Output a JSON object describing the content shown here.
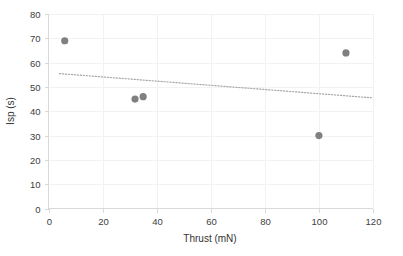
{
  "chart_data": {
    "type": "scatter",
    "title": "",
    "xlabel": "Thrust (mN)",
    "ylabel": "Isp (s)",
    "xlim": [
      0,
      120
    ],
    "ylim": [
      0,
      80
    ],
    "xticks": [
      0,
      20,
      40,
      60,
      80,
      100,
      120
    ],
    "yticks": [
      0,
      10,
      20,
      30,
      40,
      50,
      60,
      70,
      80
    ],
    "xtick_labels": [
      "0",
      "20",
      "40",
      "60",
      "80",
      "100",
      "120"
    ],
    "ytick_labels": [
      "0",
      "10",
      "20",
      "30",
      "40",
      "50",
      "60",
      "70",
      "80"
    ],
    "grid": true,
    "legend": false,
    "series": [
      {
        "name": "Isp vs Thrust",
        "marker": "circle",
        "color": "#808080",
        "points": [
          {
            "x": 6,
            "y": 69
          },
          {
            "x": 32,
            "y": 45
          },
          {
            "x": 35,
            "y": 46
          },
          {
            "x": 100,
            "y": 30
          },
          {
            "x": 110,
            "y": 64
          }
        ]
      }
    ],
    "trendline": {
      "name": "Linear trend",
      "style": "dotted",
      "color": "#a6a6a6",
      "x_start": 4,
      "y_start": 55.5,
      "x_end": 120,
      "y_end": 45.5
    }
  },
  "axes": {
    "x_title": "Thrust (mN)",
    "y_title": "Isp (s)"
  },
  "ticks": {
    "x": [
      "0",
      "20",
      "40",
      "60",
      "80",
      "100",
      "120"
    ],
    "y": [
      "0",
      "10",
      "20",
      "30",
      "40",
      "50",
      "60",
      "70",
      "80"
    ]
  },
  "colors": {
    "marker": "#808080",
    "trend": "#a6a6a6",
    "axis": "#d9d9d9",
    "grid": "#f2f2f2",
    "text": "#404040",
    "background": "#ffffff"
  }
}
